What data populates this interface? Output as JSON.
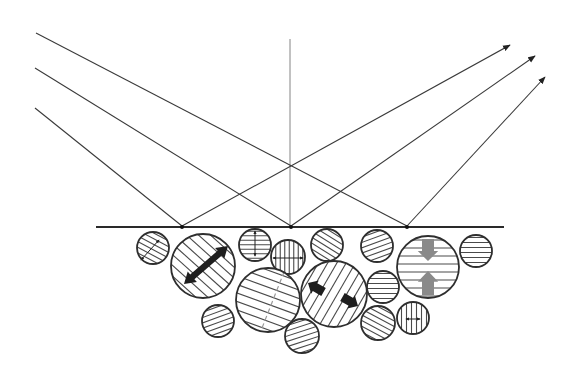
{
  "diagram": {
    "width": 573,
    "height": 378,
    "colors": {
      "line": "#3a3a3a",
      "hatch": "#4a4a4a",
      "dark_arrow": "#1e1e1e",
      "gray_arrow": "#8a8a8a",
      "dashed": "#9a9a9a",
      "background": "#ffffff"
    },
    "surface": {
      "x1": 96,
      "y1": 227,
      "x2": 504,
      "y2": 227
    },
    "normal": {
      "x": 290,
      "y1": 39,
      "y2": 227
    },
    "incident_rays": [
      {
        "x1": 36,
        "y1": 33,
        "x2": 407,
        "y2": 226
      },
      {
        "x1": 35,
        "y1": 68,
        "x2": 291,
        "y2": 226
      },
      {
        "x1": 35,
        "y1": 108,
        "x2": 182,
        "y2": 226
      }
    ],
    "reflected_rays": [
      {
        "x1": 182,
        "y1": 226,
        "x2": 510,
        "y2": 45
      },
      {
        "x1": 291,
        "y1": 226,
        "x2": 535,
        "y2": 56
      },
      {
        "x1": 407,
        "y1": 226,
        "x2": 545,
        "y2": 77
      }
    ],
    "grains": [
      {
        "id": "A",
        "cx": 153,
        "cy": 248,
        "r": 16,
        "hatch_angle": 28,
        "spacing": 5,
        "arrow": {
          "type": "thin",
          "x1": 141,
          "y1": 260,
          "x2": 159,
          "y2": 240
        }
      },
      {
        "id": "B",
        "cx": 203,
        "cy": 266,
        "r": 32,
        "hatch_angle": 42,
        "spacing": 8,
        "arrow": {
          "type": "thick-double",
          "x1": 184,
          "y1": 284,
          "x2": 228,
          "y2": 246
        }
      },
      {
        "id": "C",
        "cx": 255,
        "cy": 245,
        "r": 16,
        "hatch_angle": 0,
        "spacing": 4.5,
        "arrow": {
          "type": "thin",
          "x1": 255,
          "y1": 231,
          "x2": 255,
          "y2": 256
        }
      },
      {
        "id": "D",
        "cx": 288,
        "cy": 257,
        "r": 17,
        "hatch_angle": 90,
        "spacing": 4.5,
        "arrow": {
          "type": "thin",
          "x1": 273,
          "y1": 258,
          "x2": 303,
          "y2": 258
        }
      },
      {
        "id": "E",
        "cx": 268,
        "cy": 300,
        "r": 32,
        "hatch_angle": 20,
        "spacing": 8,
        "dashed": {
          "x1": 262,
          "y1": 328,
          "x2": 284,
          "y2": 272
        }
      },
      {
        "id": "F",
        "cx": 218,
        "cy": 321,
        "r": 16,
        "hatch_angle": -20,
        "spacing": 5
      },
      {
        "id": "G",
        "cx": 327,
        "cy": 245,
        "r": 16,
        "hatch_angle": 32,
        "spacing": 5
      },
      {
        "id": "H",
        "cx": 377,
        "cy": 246,
        "r": 16,
        "hatch_angle": -20,
        "spacing": 5
      },
      {
        "id": "I",
        "cx": 428,
        "cy": 267,
        "r": 31,
        "hatch_angle": 0,
        "spacing": 8,
        "gray_arrows": true
      },
      {
        "id": "J",
        "cx": 476,
        "cy": 251,
        "r": 16,
        "hatch_angle": 0,
        "spacing": 5
      },
      {
        "id": "K",
        "cx": 334,
        "cy": 294,
        "r": 33,
        "hatch_angle": -60,
        "spacing": 8,
        "outward_arrows": true
      },
      {
        "id": "L",
        "cx": 383,
        "cy": 287,
        "r": 16,
        "hatch_angle": 0,
        "spacing": 5
      },
      {
        "id": "M",
        "cx": 378,
        "cy": 323,
        "r": 17,
        "hatch_angle": 28,
        "spacing": 5
      },
      {
        "id": "N",
        "cx": 413,
        "cy": 318,
        "r": 16,
        "hatch_angle": 90,
        "spacing": 5,
        "arrow": {
          "type": "thin",
          "x1": 406,
          "y1": 319,
          "x2": 420,
          "y2": 319
        }
      },
      {
        "id": "O",
        "cx": 302,
        "cy": 336,
        "r": 17,
        "hatch_angle": -18,
        "spacing": 5
      }
    ]
  }
}
